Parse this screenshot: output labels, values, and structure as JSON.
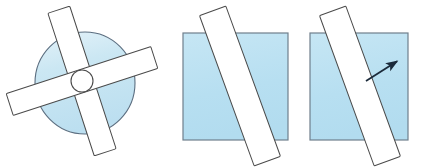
{
  "figure": {
    "canvas": {
      "width": 423,
      "height": 167,
      "background": "#ffffff"
    },
    "colors": {
      "disc_fill": "#c3e3f1",
      "disc_fill_light": "#dff0f8",
      "square_fill": "#b9e0f2",
      "bar_fill": "#ffffff",
      "outline_disc": "#5b6e80",
      "outline_square": "#6f7f8c",
      "outline_bar": "#4a4a4a",
      "arrow": "#1b2a3a"
    },
    "panels": [
      {
        "id": "panel-disc-with-cross-bars",
        "label": "disc with two crossed bars",
        "shape": "circle",
        "circle": {
          "cx": 85,
          "cy": 83,
          "rx": 50,
          "ry": 51
        },
        "hub": {
          "cx": 82,
          "cy": 81,
          "r": 11
        },
        "bars": [
          {
            "id": "bar-steep",
            "angle_deg": 18,
            "length": 150,
            "width": 23,
            "cx": 82,
            "cy": 81
          },
          {
            "id": "bar-shallow",
            "angle_deg": 108,
            "length": 152,
            "width": 23,
            "cx": 82,
            "cy": 81
          }
        ]
      },
      {
        "id": "panel-square-with-slit",
        "label": "square plate with diagonal slit bar",
        "shape": "square",
        "square": {
          "x": 183,
          "y": 33,
          "width": 105,
          "height": 107
        },
        "bars": [
          {
            "id": "bar-diagonal",
            "angle_deg": 20,
            "length": 160,
            "width": 28,
            "cx": 240,
            "cy": 86
          }
        ]
      },
      {
        "id": "panel-square-with-slit-and-arrow",
        "label": "square plate with diagonal slit bar and motion arrow",
        "shape": "square",
        "square": {
          "x": 310,
          "y": 33,
          "width": 98,
          "height": 107
        },
        "bars": [
          {
            "id": "bar-diagonal",
            "angle_deg": 20,
            "length": 160,
            "width": 28,
            "cx": 360,
            "cy": 86
          }
        ],
        "arrow": {
          "id": "motion-arrow",
          "from": {
            "x": 366,
            "y": 81
          },
          "to": {
            "x": 399,
            "y": 60
          },
          "direction": "up-right",
          "angle_deg": 32,
          "head_length": 9,
          "stroke_width": 1.8
        }
      }
    ]
  }
}
